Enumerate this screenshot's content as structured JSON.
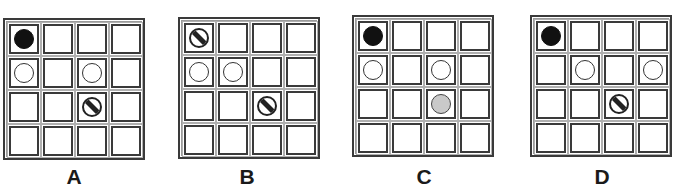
{
  "heading": {
    "text": "",
    "note_visible": "cropped heading – only descender sliver visible"
  },
  "legend": {
    "disc_types": {
      "black": "solid black disc",
      "white": "white (hollow) disc",
      "gray": "light gray disc",
      "striped": "disc with diagonal stripe"
    },
    "colors": {
      "black": "#111111",
      "gray": "#c9c9c9",
      "outline": "#3a3a3a",
      "background": "#ffffff"
    }
  },
  "grid_size": {
    "rows": 4,
    "cols": 4
  },
  "options": [
    {
      "label": "A",
      "discs": [
        {
          "row": 0,
          "col": 0,
          "type": "black"
        },
        {
          "row": 1,
          "col": 0,
          "type": "white"
        },
        {
          "row": 1,
          "col": 2,
          "type": "white"
        },
        {
          "row": 2,
          "col": 2,
          "type": "striped"
        }
      ]
    },
    {
      "label": "B",
      "discs": [
        {
          "row": 0,
          "col": 0,
          "type": "striped"
        },
        {
          "row": 1,
          "col": 0,
          "type": "white"
        },
        {
          "row": 1,
          "col": 1,
          "type": "white"
        },
        {
          "row": 2,
          "col": 2,
          "type": "striped"
        }
      ]
    },
    {
      "label": "C",
      "discs": [
        {
          "row": 0,
          "col": 0,
          "type": "black"
        },
        {
          "row": 1,
          "col": 0,
          "type": "white"
        },
        {
          "row": 1,
          "col": 2,
          "type": "white"
        },
        {
          "row": 2,
          "col": 2,
          "type": "gray"
        }
      ]
    },
    {
      "label": "D",
      "discs": [
        {
          "row": 0,
          "col": 0,
          "type": "black"
        },
        {
          "row": 1,
          "col": 1,
          "type": "white"
        },
        {
          "row": 1,
          "col": 3,
          "type": "white"
        },
        {
          "row": 2,
          "col": 2,
          "type": "striped"
        }
      ]
    }
  ]
}
